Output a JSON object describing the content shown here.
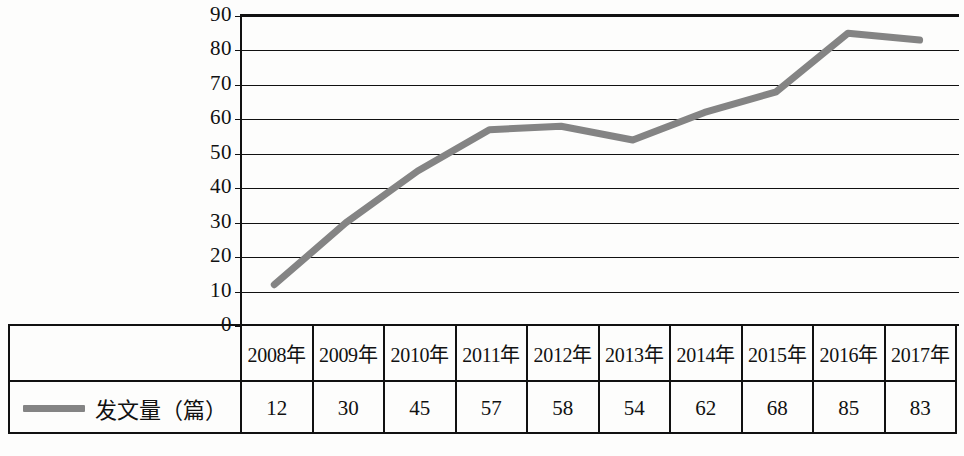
{
  "chart_data": {
    "type": "line",
    "title": "",
    "xlabel": "",
    "ylabel": "",
    "categories": [
      "2008年",
      "2009年",
      "2010年",
      "2011年",
      "2012年",
      "2013年",
      "2014年",
      "2015年",
      "2016年",
      "2017年"
    ],
    "series": [
      {
        "name": "发文量（篇）",
        "values": [
          12,
          30,
          45,
          57,
          58,
          54,
          62,
          68,
          85,
          83
        ],
        "color": "#848484"
      }
    ],
    "ylim": [
      0,
      90
    ],
    "yticks": [
      90,
      80,
      70,
      60,
      50,
      40,
      30,
      20,
      10,
      0
    ],
    "ytick_labels": [
      "90",
      "80",
      "70",
      "60",
      "50",
      "40",
      "30",
      "20",
      "10",
      "0"
    ],
    "grid": true,
    "legend_position": "table-left"
  },
  "table": {
    "legend_label": "发文量（篇）",
    "legend_marker": "line-swatch"
  },
  "colors": {
    "line": "#848484",
    "axis": "#111111",
    "background": "#fdfdfc"
  }
}
